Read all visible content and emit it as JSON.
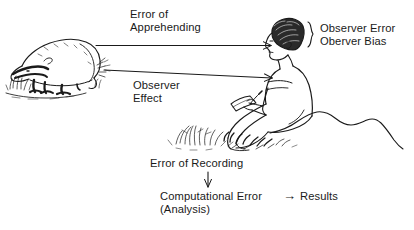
{
  "diagram": {
    "background_color": "#ffffff",
    "ink_color": "#1a1a1a",
    "labels": {
      "error_of_apprehending_line1": "Error of",
      "error_of_apprehending_line2": "Apprehending",
      "observer_error": "Observer Error",
      "oberver_bias": "Oberver Bias",
      "observer_effect_line1": "Observer",
      "observer_effect_line2": "Effect",
      "error_of_recording": "Error of Recording",
      "computational_error": "Computational Error",
      "analysis": "(Analysis)",
      "results": "Results",
      "arrow_to_results_glyph": "→"
    },
    "illustrations": [
      {
        "name": "badger-animal-illustration",
        "description": "Line drawing of a badger on the ground with tufts of grass"
      },
      {
        "name": "observer-person-illustration",
        "description": "Line drawing of a person seated on a rock writing on a notepad, grass in foreground"
      }
    ],
    "connectors": [
      {
        "name": "arrow-error-of-apprehending",
        "from": "badger-animal-illustration",
        "to": "observer-person-illustration",
        "direction": "right",
        "label": "Error of Apprehending"
      },
      {
        "name": "arrow-observer-effect",
        "from": "observer-person-illustration",
        "to": "badger-animal-illustration",
        "direction": "left",
        "label": "Observer Effect"
      },
      {
        "name": "arrow-error-of-recording",
        "from": "observer-person-illustration",
        "to": "computational-error",
        "direction": "down",
        "label": "Error of Recording"
      },
      {
        "name": "arrow-to-results",
        "from": "computational-error",
        "to": "results",
        "direction": "right",
        "label": ""
      }
    ],
    "brace": {
      "name": "curly-brace-observer-labels",
      "groups": [
        "Observer Error",
        "Oberver Bias"
      ]
    }
  }
}
